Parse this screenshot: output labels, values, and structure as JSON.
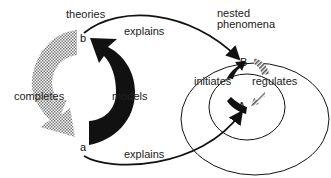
{
  "diagram": {
    "left_cycle": {
      "group_label": "theories",
      "node_b": "b",
      "node_a": "a",
      "edge_completes": "completes",
      "edge_models": "models"
    },
    "right_cycle": {
      "group_label_line1": "nested",
      "group_label_line2": "phenomena",
      "node_B": "B",
      "node_A": "A",
      "edge_initiates": "initiates",
      "edge_regulates": "regulates"
    },
    "cross_edges": {
      "top": "explains",
      "bottom": "explains"
    },
    "colors": {
      "ink": "#111111",
      "hatch": "#888888",
      "background": "#ffffff"
    }
  }
}
